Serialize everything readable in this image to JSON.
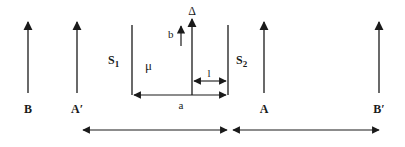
{
  "diagram": {
    "type": "optics-double-slit-arrangement",
    "colors": {
      "stroke": "#1a1a1a",
      "background": "#ffffff"
    },
    "objects": [
      {
        "id": "B",
        "label": "B",
        "x": 28
      },
      {
        "id": "A_prime",
        "label": "A′",
        "x": 77
      },
      {
        "id": "A",
        "label": "A",
        "x": 264
      },
      {
        "id": "B_prime",
        "label": "B′",
        "x": 379
      }
    ],
    "slits": {
      "s1": {
        "label": "S",
        "sub": "1",
        "x": 132
      },
      "s2": {
        "label": "S",
        "sub": "2",
        "x": 228
      }
    },
    "medium_label": "μ",
    "axis_label": "Δ",
    "small_arrow_label": "b",
    "distance_l_label": "l",
    "distance_a_label": "a"
  }
}
